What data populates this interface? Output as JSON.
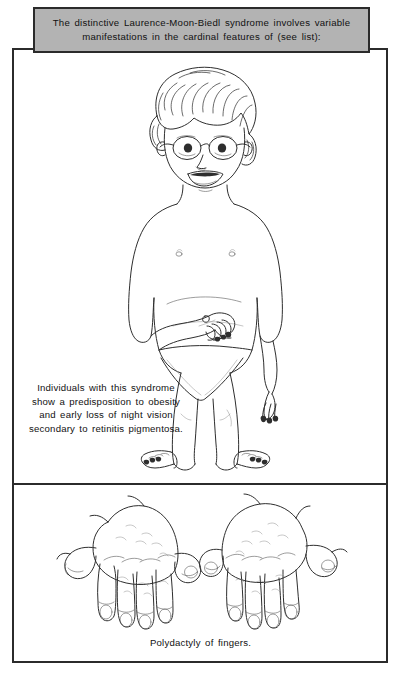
{
  "header": {
    "line1": "The distinctive Laurence-Moon-Biedl syndrome involves variable",
    "line2": "manifestations in the cardinal features of (see list):",
    "background_color": "#b3b3b3",
    "border_color": "#2b2b2b"
  },
  "body": {
    "line1": "Individuals with this syndrome",
    "line2": "show a predisposition to obesity",
    "line3": "and early loss of night vision",
    "line4": "secondary to retinitis pigmentosa."
  },
  "hands": {
    "caption": "Polydactyly of fingers."
  },
  "illustrations": {
    "child": "child-with-glasses-obesity-figure",
    "hands": "two-hands-polydactyly-figure"
  },
  "colors": {
    "ink": "#2e2e2e",
    "paper": "#ffffff",
    "header_gray": "#b3b3b3"
  }
}
